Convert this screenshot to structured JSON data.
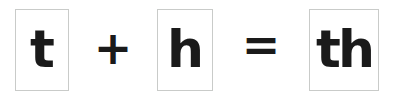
{
  "diagram": {
    "kind": "phonics-blend-equation",
    "expression": "t + h = th",
    "colors": {
      "background": "#ffffff",
      "glyph": "#1a1a1a",
      "card_border": "#c9cbc9"
    },
    "terms": [
      {
        "id": "term-t",
        "letter": "t",
        "role": "operand"
      },
      {
        "id": "term-h",
        "letter": "h",
        "role": "operand"
      },
      {
        "id": "term-th",
        "letter": "th",
        "role": "result"
      }
    ],
    "operators": [
      {
        "id": "op-plus",
        "symbol": "+",
        "name": "plus-sign"
      },
      {
        "id": "op-equals",
        "symbol": "=",
        "name": "equals-sign"
      }
    ]
  }
}
